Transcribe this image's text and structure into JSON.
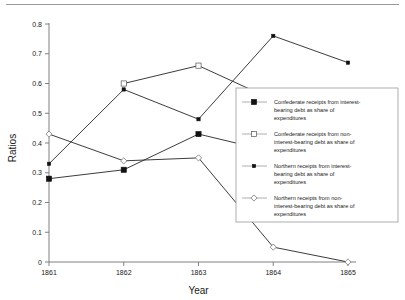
{
  "chart_data": {
    "type": "line",
    "title": "",
    "xlabel": "Year",
    "ylabel": "Ratios",
    "categories": [
      "1861",
      "1862",
      "1863",
      "1864",
      "1865"
    ],
    "x": [
      1861,
      1862,
      1863,
      1864,
      1865
    ],
    "xlim": [
      1861,
      1865
    ],
    "ylim": [
      0,
      0.8
    ],
    "ytick_labels": [
      "0.8",
      "0.7",
      "0.6",
      "0.5",
      "0.4",
      "0.3",
      "0.2",
      "0.1",
      "0"
    ],
    "ytick_values": [
      0.8,
      0.7,
      0.6,
      0.5,
      0.4,
      0.3,
      0.2,
      0.1,
      0
    ],
    "grid": false,
    "legend_position": "right",
    "series": [
      {
        "name": "Confederate receipts from interest-bearing debt as share of expenditures",
        "marker": "filled-square",
        "values": [
          0.28,
          0.31,
          0.43,
          0.37,
          null
        ]
      },
      {
        "name": "Confederate receipts from non-interest-bearing debt as share of expenditures",
        "marker": "open-square",
        "values": [
          null,
          0.6,
          0.66,
          0.545,
          null
        ]
      },
      {
        "name": "Northern receipts from interest-bearing debt as share of expenditures",
        "marker": "small-filled-square",
        "values": [
          0.33,
          0.58,
          0.48,
          0.76,
          0.67
        ]
      },
      {
        "name": "Northern receipts from non-interest-bearing debt as share of expenditures",
        "marker": "open-diamond",
        "values": [
          0.43,
          0.34,
          0.35,
          0.05,
          0.0
        ]
      }
    ]
  },
  "legend": {
    "entries": [
      {
        "marker": "filled-square",
        "lines": [
          "Confederate receipts from interest-",
          "bearing debt as share of",
          "expenditures"
        ]
      },
      {
        "marker": "open-square",
        "lines": [
          "Confederate receipts from non-",
          "interest-bearing debt as share of",
          "expenditures"
        ]
      },
      {
        "marker": "small-filled-square",
        "lines": [
          "Northern receipts from interest-",
          "bearing debt as share of",
          "expenditures"
        ]
      },
      {
        "marker": "open-diamond",
        "lines": [
          "Northern receipts from non-",
          "interest-bearing debt as share of",
          "expenditures"
        ]
      }
    ]
  },
  "axes": {
    "y_title": "Ratios",
    "x_title": "Year"
  }
}
